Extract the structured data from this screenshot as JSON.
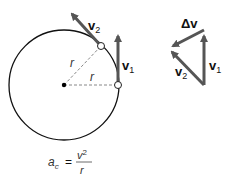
{
  "diagram": {
    "circle": {
      "cx": 64,
      "cy": 85,
      "r": 55
    },
    "labels": {
      "v2_main": "v",
      "v2_sub": "2",
      "v1_main": "v",
      "v1_sub": "1",
      "radius_upper": "r",
      "radius_lower": "r",
      "delta_v": "Δv",
      "tri_v1_main": "v",
      "tri_v1_sub": "1",
      "tri_v2_main": "v",
      "tri_v2_sub": "2"
    },
    "formula": {
      "lhs_main": "a",
      "lhs_sub": "c",
      "equals": "=",
      "numerator": "v",
      "numerator_sup": "2",
      "denominator": "r"
    },
    "colors": {
      "arrow": "#555555",
      "circle": "#111111",
      "dashed": "#888888"
    }
  }
}
